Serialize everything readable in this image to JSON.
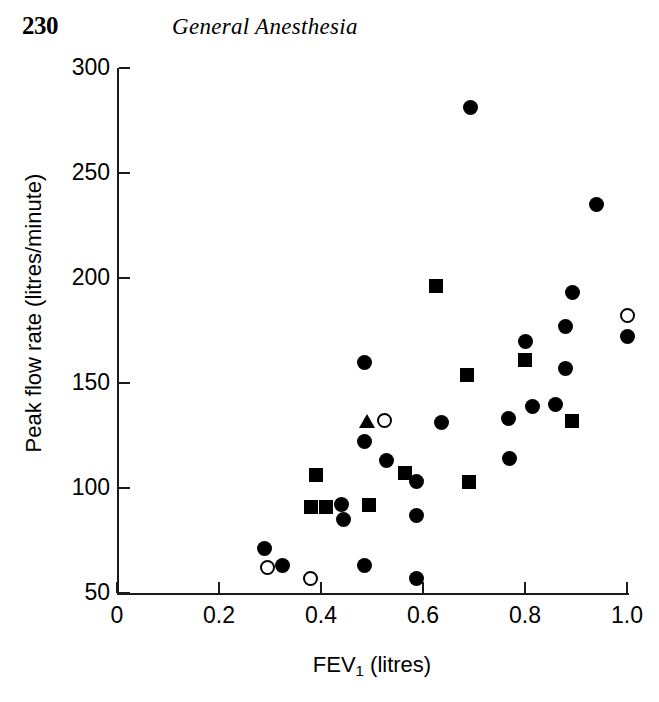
{
  "page": {
    "number": "230",
    "running_head": "General Anesthesia"
  },
  "chart_data": {
    "type": "scatter",
    "title": "",
    "xlabel": "FEV",
    "xlabel_sub": "1",
    "xlabel_unit": " (litres)",
    "xlabel_full": "FEV1 (litres)",
    "ylabel": "Peak flow rate (litres/minute)",
    "xlim": [
      0,
      1.0
    ],
    "ylim": [
      50,
      300
    ],
    "xticks": [
      0,
      0.2,
      0.4,
      0.6,
      0.8,
      1.0
    ],
    "xtick_labels": [
      "0",
      "0.2",
      "0.4",
      "0.6",
      "0.8",
      "1.0"
    ],
    "yticks": [
      50,
      100,
      150,
      200,
      250,
      300
    ],
    "ytick_labels": [
      "50",
      "100",
      "150",
      "200",
      "250",
      "300"
    ],
    "grid": false,
    "legend": "none",
    "series": [
      {
        "name": "filled-circle",
        "marker": "circle-filled",
        "points": [
          [
            0.29,
            71
          ],
          [
            0.325,
            63
          ],
          [
            0.44,
            92
          ],
          [
            0.445,
            85
          ],
          [
            0.486,
            160
          ],
          [
            0.486,
            122
          ],
          [
            0.486,
            63
          ],
          [
            0.528,
            113
          ],
          [
            0.588,
            103
          ],
          [
            0.588,
            87
          ],
          [
            0.588,
            57
          ],
          [
            0.637,
            131
          ],
          [
            0.693,
            281
          ],
          [
            0.767,
            133
          ],
          [
            0.77,
            114
          ],
          [
            0.8,
            170
          ],
          [
            0.815,
            139
          ],
          [
            0.86,
            140
          ],
          [
            0.88,
            177
          ],
          [
            0.88,
            157
          ],
          [
            0.893,
            193
          ],
          [
            0.94,
            235
          ],
          [
            1.0,
            172
          ]
        ]
      },
      {
        "name": "filled-square",
        "marker": "square-filled",
        "points": [
          [
            0.39,
            106
          ],
          [
            0.38,
            91
          ],
          [
            0.41,
            91
          ],
          [
            0.495,
            92
          ],
          [
            0.565,
            107
          ],
          [
            0.625,
            196
          ],
          [
            0.686,
            154
          ],
          [
            0.69,
            103
          ],
          [
            0.8,
            161
          ],
          [
            0.893,
            132
          ]
        ]
      },
      {
        "name": "open-circle",
        "marker": "circle-open",
        "points": [
          [
            0.295,
            62
          ],
          [
            0.38,
            57
          ],
          [
            0.525,
            132
          ],
          [
            1.0,
            182
          ]
        ]
      },
      {
        "name": "filled-triangle",
        "marker": "triangle-filled",
        "points": [
          [
            0.49,
            132
          ]
        ]
      }
    ]
  }
}
